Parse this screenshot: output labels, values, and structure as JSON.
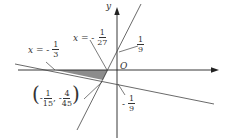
{
  "diagram": {
    "type": "coordinate-plane-linear-inequalities",
    "axes": {
      "x_label": "x",
      "y_label": "y",
      "origin_label": "O"
    },
    "lines": [
      {
        "name": "steep-line",
        "y_intercept_label": {
          "sign": "",
          "num": "1",
          "den": "9"
        }
      },
      {
        "name": "shallow-line",
        "y_intercept_label": {
          "sign": "-",
          "num": "1",
          "den": "9"
        }
      }
    ],
    "vertical_markers": [
      {
        "prefix": "x = ",
        "sign": "-",
        "num": "1",
        "den": "3"
      },
      {
        "prefix": "x = ",
        "sign": "-",
        "num": "1",
        "den": "27"
      }
    ],
    "intersection_point": {
      "x": {
        "sign": "-",
        "num": "1",
        "den": "15"
      },
      "y": {
        "sign": "-",
        "num": "4",
        "den": "45"
      },
      "separator": ","
    },
    "shaded_region": {
      "color": "#8c8c8c"
    },
    "colors": {
      "axis": "#222222",
      "line": "#444444",
      "shade": "#8c8c8c"
    }
  }
}
